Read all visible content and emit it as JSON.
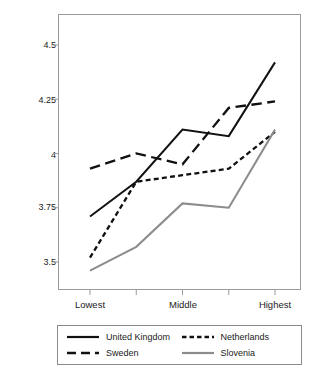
{
  "chart_data": {
    "type": "line",
    "title": "",
    "xlabel": "",
    "ylabel": "Health Average",
    "categories": [
      "Lowest",
      "",
      "Middle",
      "",
      "Highest"
    ],
    "x_tick_labels": [
      "Lowest",
      "Middle",
      "Highest"
    ],
    "y_tick_labels": [
      "4.5",
      "4.25",
      "4",
      "3.75",
      "3.5"
    ],
    "y_ticks": [
      4.5,
      4.25,
      4,
      3.75,
      3.5
    ],
    "ylim": [
      3.38,
      4.55
    ],
    "xlim": [
      0,
      4
    ],
    "grid": false,
    "legend_position": "bottom",
    "series": [
      {
        "name": "United Kingdom",
        "style": "solid",
        "color": "#111111",
        "values": [
          3.71,
          3.87,
          4.11,
          4.08,
          4.42
        ]
      },
      {
        "name": "Sweden",
        "style": "long-dash",
        "color": "#111111",
        "values": [
          3.93,
          4.0,
          3.95,
          4.21,
          4.24
        ]
      },
      {
        "name": "Netherlands",
        "style": "dotted",
        "color": "#111111",
        "values": [
          3.52,
          3.87,
          3.9,
          3.93,
          4.1
        ]
      },
      {
        "name": "Slovenia",
        "style": "solid",
        "color": "#8c8c8c",
        "values": [
          3.46,
          3.57,
          3.77,
          3.75,
          4.11
        ]
      }
    ]
  },
  "axis": {
    "y_label": "Health Average",
    "y_tick_0": "4.5",
    "y_tick_1": "4.25",
    "y_tick_2": "4",
    "y_tick_3": "3.75",
    "y_tick_4": "3.5",
    "x_tick_0": "Lowest",
    "x_tick_1": "Middle",
    "x_tick_2": "Highest"
  },
  "legend": {
    "items": [
      {
        "label": "United Kingdom",
        "style": "solid",
        "color": "#111111"
      },
      {
        "label": "Netherlands",
        "style": "dotted",
        "color": "#111111"
      },
      {
        "label": "Sweden",
        "style": "long-dash",
        "color": "#111111"
      },
      {
        "label": "Slovenia",
        "style": "solid",
        "color": "#8c8c8c"
      }
    ]
  },
  "colors": {
    "axis": "#8a8a8a",
    "text": "#1a1a1a",
    "series_dark": "#111111",
    "series_gray": "#8c8c8c",
    "background": "#ffffff"
  }
}
